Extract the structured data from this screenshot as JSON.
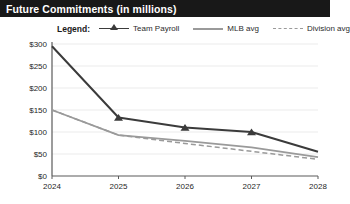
{
  "header": {
    "title": "Future Commitments (in millions)",
    "bar_color": "#181818",
    "text_color": "#ffffff"
  },
  "legend": {
    "label": "Legend:",
    "entries": [
      {
        "name": "Team Payroll",
        "marker": "triangle-marker-line",
        "color": "#3b3b3b",
        "dash": false
      },
      {
        "name": "MLB avg",
        "marker": "solid-line",
        "color": "#9a9a9a",
        "dash": false
      },
      {
        "name": "Division avg",
        "marker": "dashed-line",
        "color": "#9a9a9a",
        "dash": true
      }
    ]
  },
  "chart_data": {
    "type": "line",
    "title": "Future Commitments (in millions)",
    "xlabel": "",
    "ylabel": "",
    "x": [
      "2024",
      "2025",
      "2026",
      "2027",
      "2028"
    ],
    "categories": [
      "2024",
      "2025",
      "2026",
      "2027",
      "2028"
    ],
    "ylim": [
      0,
      300
    ],
    "yticks": [
      0,
      50,
      100,
      150,
      200,
      250,
      300
    ],
    "ytick_labels": [
      "$0",
      "$50",
      "$100",
      "$150",
      "$200",
      "$250",
      "$300"
    ],
    "xtick_labels": [
      "2024",
      "2025",
      "2026",
      "2027",
      "2028"
    ],
    "grid": true,
    "legend_position": "top",
    "series": [
      {
        "name": "Team Payroll",
        "values": [
          295,
          133,
          110,
          100,
          55
        ],
        "color": "#3b3b3b",
        "dash": false,
        "markers": true
      },
      {
        "name": "MLB avg",
        "values": [
          150,
          93,
          80,
          65,
          43
        ],
        "color": "#9a9a9a",
        "dash": false,
        "markers": false
      },
      {
        "name": "Division avg",
        "values": [
          150,
          93,
          74,
          56,
          38
        ],
        "color": "#9a9a9a",
        "dash": true,
        "markers": false
      }
    ]
  }
}
